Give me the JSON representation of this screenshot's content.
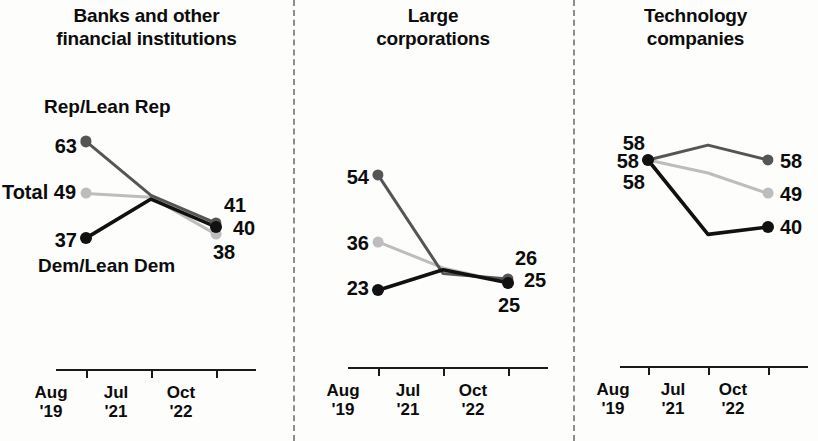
{
  "chart_data": {
    "type": "line",
    "title": "",
    "xlabel": "",
    "ylabel": "",
    "x": [
      "Aug '19",
      "Jul '21",
      "Oct '22"
    ],
    "ylim": [
      20,
      70
    ],
    "grid": false,
    "legend_position": "inline-annotations",
    "panels": [
      {
        "title": "Banks and other\nfinancial institutions",
        "series": [
          {
            "name": "Rep/Lean Rep",
            "color": "#555555",
            "values": [
              63,
              null,
              41
            ],
            "labels": [
              "63",
              "",
              "41"
            ]
          },
          {
            "name": "Total",
            "color": "#bdbdbd",
            "values": [
              49,
              null,
              38
            ],
            "labels": [
              "Total 49",
              "",
              "38"
            ]
          },
          {
            "name": "Dem/Lean Dem",
            "color": "#111111",
            "values": [
              37,
              null,
              40
            ],
            "labels": [
              "37",
              "",
              "40"
            ]
          }
        ]
      },
      {
        "title": "Large\ncorporations",
        "series": [
          {
            "name": "Rep/Lean Rep",
            "color": "#555555",
            "values": [
              54,
              null,
              26
            ],
            "labels": [
              "54",
              "",
              "26"
            ]
          },
          {
            "name": "Total",
            "color": "#bdbdbd",
            "values": [
              36,
              null,
              25
            ],
            "labels": [
              "36",
              "",
              "25"
            ]
          },
          {
            "name": "Dem/Lean Dem",
            "color": "#111111",
            "values": [
              23,
              null,
              25
            ],
            "labels": [
              "23",
              "",
              "25"
            ]
          }
        ]
      },
      {
        "title": "Technology\ncompanies",
        "series": [
          {
            "name": "Rep/Lean Rep",
            "color": "#555555",
            "values": [
              58,
              null,
              58
            ],
            "labels": [
              "58",
              "",
              "58"
            ]
          },
          {
            "name": "Total",
            "color": "#bdbdbd",
            "values": [
              58,
              null,
              49
            ],
            "labels": [
              "58",
              "",
              "49"
            ]
          },
          {
            "name": "Dem/Lean Dem",
            "color": "#111111",
            "values": [
              58,
              null,
              40
            ],
            "labels": [
              "58",
              "",
              "40"
            ]
          }
        ]
      }
    ],
    "annotations": {
      "rep_label": "Rep/Lean Rep",
      "dem_label": "Dem/Lean Dem"
    },
    "tick_labels": [
      {
        "line1": "Aug",
        "line2": "'19"
      },
      {
        "line1": "Jul",
        "line2": "'21"
      },
      {
        "line1": "Oct",
        "line2": "'22"
      }
    ]
  }
}
